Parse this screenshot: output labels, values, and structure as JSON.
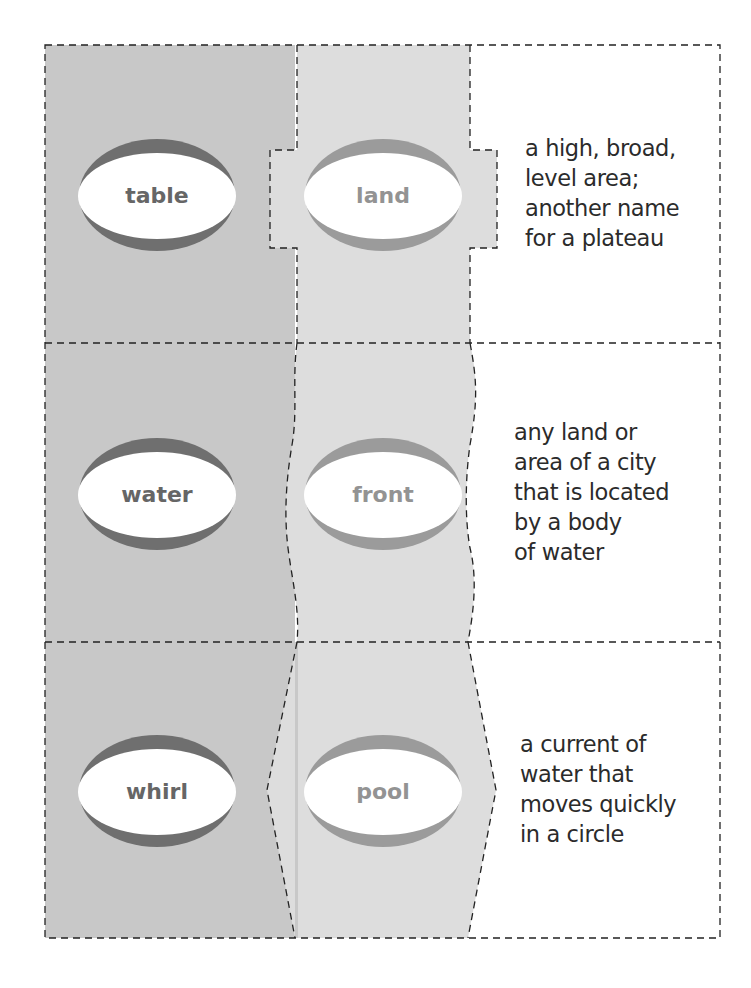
{
  "worksheet": {
    "title": "Compound word cards",
    "colors": {
      "left_panel": "#c8c8c8",
      "middle_panel": "#dddddd",
      "dark_rim": "#6f6f6f",
      "light_rim": "#9b9b9b",
      "dark_word": "#666666",
      "light_word": "#939393",
      "definition_text": "#2b2b2b",
      "cut_line": "#222222"
    },
    "rows": [
      {
        "first_part": "table",
        "second_part": "land",
        "definition": [
          "a high, broad,",
          "level area;",
          "another name",
          "for a plateau"
        ]
      },
      {
        "first_part": "water",
        "second_part": "front",
        "definition": [
          "any land or",
          "area of a city",
          "that is located",
          "by a body",
          "of water"
        ]
      },
      {
        "first_part": "whirl",
        "second_part": "pool",
        "definition": [
          "a current of",
          "water that",
          "moves quickly",
          "in a circle"
        ]
      }
    ]
  }
}
